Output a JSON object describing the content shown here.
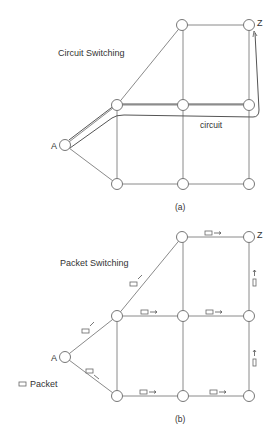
{
  "diagram_a": {
    "title": "Circuit Switching",
    "path_label": "circuit",
    "source_label": "A",
    "dest_label": "Z",
    "caption": "(a)"
  },
  "diagram_b": {
    "title": "Packet Switching",
    "source_label": "A",
    "dest_label": "Z",
    "legend_label": "Packet",
    "caption": "(b)"
  },
  "colors": {
    "edge": "#8a8a8a",
    "node_stroke": "#777777",
    "text": "#333333",
    "background": "#ffffff"
  }
}
